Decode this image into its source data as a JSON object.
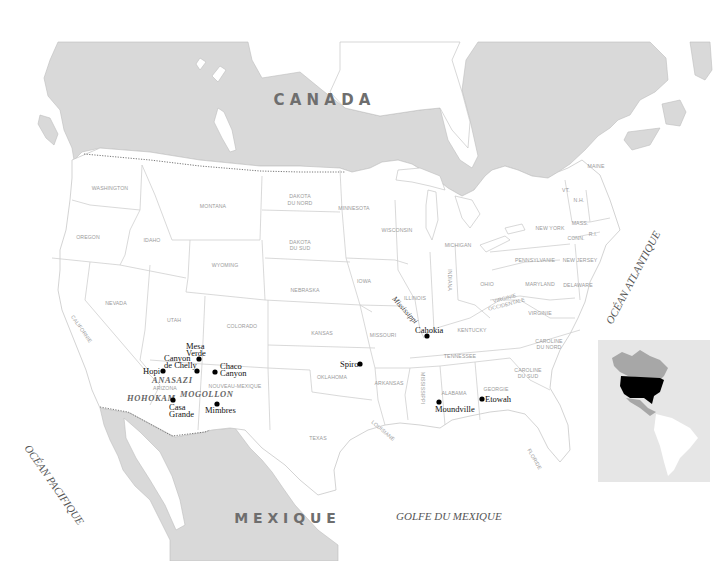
{
  "map": {
    "countries": [
      {
        "id": "canada",
        "label": "C A N A D A"
      },
      {
        "id": "mexique",
        "label": "M E X I Q U E"
      }
    ],
    "oceans": [
      {
        "id": "atlantique",
        "label": "OCÉAN ATLANTIQUE"
      },
      {
        "id": "pacifique",
        "label": "OCÉAN PACIFIQUE"
      },
      {
        "id": "golfe",
        "label": "GOLFE DU MEXIQUE"
      }
    ],
    "rivers": [
      {
        "id": "mississippi",
        "label": "Mississippi"
      }
    ],
    "states": [
      {
        "id": "washington",
        "label": "WASHINGTON"
      },
      {
        "id": "oregon",
        "label": "OREGON"
      },
      {
        "id": "idaho",
        "label": "IDAHO"
      },
      {
        "id": "montana",
        "label": "MONTANA"
      },
      {
        "id": "wyoming",
        "label": "WYOMING"
      },
      {
        "id": "nevada",
        "label": "NEVADA"
      },
      {
        "id": "california",
        "label": "CALIFORNIE"
      },
      {
        "id": "utah",
        "label": "UTAH"
      },
      {
        "id": "colorado",
        "label": "COLORADO"
      },
      {
        "id": "arizona",
        "label": "ARIZONA"
      },
      {
        "id": "new-mexico",
        "label": "NOUVEAU-MEXIQUE"
      },
      {
        "id": "north-dakota",
        "label": [
          "DAKOTA",
          "DU NORD"
        ]
      },
      {
        "id": "south-dakota",
        "label": [
          "DAKOTA",
          "DU SUD"
        ]
      },
      {
        "id": "nebraska",
        "label": "NEBRASKA"
      },
      {
        "id": "kansas",
        "label": "KANSAS"
      },
      {
        "id": "oklahoma",
        "label": "OKLAHOMA"
      },
      {
        "id": "texas",
        "label": "TEXAS"
      },
      {
        "id": "minnesota",
        "label": "MINNESOTA"
      },
      {
        "id": "iowa",
        "label": "IOWA"
      },
      {
        "id": "missouri",
        "label": "MISSOURI"
      },
      {
        "id": "arkansas",
        "label": "ARKANSAS"
      },
      {
        "id": "louisiana",
        "label": "LOUISIANE"
      },
      {
        "id": "wisconsin",
        "label": "WISCONSIN"
      },
      {
        "id": "illinois",
        "label": "ILLINOIS"
      },
      {
        "id": "michigan",
        "label": "MICHIGAN"
      },
      {
        "id": "indiana",
        "label": "INDIANA"
      },
      {
        "id": "ohio",
        "label": "OHIO"
      },
      {
        "id": "kentucky",
        "label": "KENTUCKY"
      },
      {
        "id": "tennessee",
        "label": "TENNESSEE"
      },
      {
        "id": "mississippi-state",
        "label": "MISSISSIPPI"
      },
      {
        "id": "alabama",
        "label": "ALABAMA"
      },
      {
        "id": "georgia",
        "label": "GEORGIE"
      },
      {
        "id": "florida",
        "label": "FLORIDE"
      },
      {
        "id": "south-carolina",
        "label": [
          "CAROLINE",
          "DU SUD"
        ]
      },
      {
        "id": "north-carolina",
        "label": [
          "CAROLINE",
          "DU NORD"
        ]
      },
      {
        "id": "virginia",
        "label": "VIRGINIE"
      },
      {
        "id": "west-virginia",
        "label": [
          "VIRGINIE",
          "OCCIDENTALE"
        ]
      },
      {
        "id": "pennsylvania",
        "label": "PENNSYLVANIE"
      },
      {
        "id": "maryland",
        "label": "MARYLAND"
      },
      {
        "id": "delaware",
        "label": "DELAWARE"
      },
      {
        "id": "new-jersey",
        "label": "NEW JERSEY"
      },
      {
        "id": "new-york",
        "label": "NEW YORK"
      },
      {
        "id": "connecticut",
        "label": "CONN."
      },
      {
        "id": "rhode-island",
        "label": "R.I."
      },
      {
        "id": "massachusetts",
        "label": "MASS."
      },
      {
        "id": "vermont",
        "label": "VT."
      },
      {
        "id": "new-hampshire",
        "label": "N.H."
      },
      {
        "id": "maine",
        "label": "MAINE"
      }
    ],
    "cultures": [
      {
        "id": "anasazi",
        "label": "ANASAZI"
      },
      {
        "id": "hohokam",
        "label": "HOHOKAM"
      },
      {
        "id": "mogollon",
        "label": "MOGOLLON"
      }
    ],
    "sites": [
      {
        "id": "mesa-verde",
        "label": [
          "Mesa",
          "Verde"
        ]
      },
      {
        "id": "canyon-de-chelly",
        "label": [
          "Canyon",
          "de Chelly"
        ]
      },
      {
        "id": "hopi",
        "label": "Hopi"
      },
      {
        "id": "chaco-canyon",
        "label": [
          "Chaco",
          "Canyon"
        ]
      },
      {
        "id": "casa-grande",
        "label": [
          "Casa",
          "Grande"
        ]
      },
      {
        "id": "mimbres",
        "label": "Mimbres"
      },
      {
        "id": "spiro",
        "label": "Spiro"
      },
      {
        "id": "cahokia",
        "label": "Cahokia"
      },
      {
        "id": "moundville",
        "label": "Moundville"
      },
      {
        "id": "etowah",
        "label": "Etowah"
      }
    ],
    "inset": {
      "label": "locator-map-americas",
      "highlight": "United States"
    },
    "colors": {
      "foreign_land": "#d9d9d9",
      "us_land": "#ffffff",
      "state_label": "#9a9a9a",
      "country_label": "#6e6e6e",
      "site_dot": "#000000",
      "inset_highlight": "#000000"
    }
  }
}
